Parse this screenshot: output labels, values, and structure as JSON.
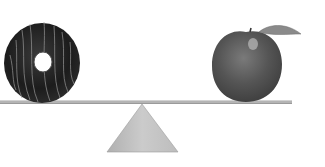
{
  "image": {
    "alt": "A chocolate glazed donut and an apple balanced on a seesaw plank resting on a triangular fulcrum",
    "objects": [
      {
        "name": "donut",
        "side": "left",
        "description": "chocolate-glazed donut with drizzle stripes"
      },
      {
        "name": "apple",
        "side": "right",
        "description": "apple with stem and leaf"
      },
      {
        "name": "plank",
        "description": "flat seesaw board"
      },
      {
        "name": "fulcrum",
        "description": "triangular pivot"
      }
    ],
    "colors": {
      "background": "#ffffff",
      "donut_dark": "#1e1e1e",
      "donut_drizzle": "#9a9a9a",
      "apple_body": "#5a5a5a",
      "apple_highlight": "#a8a8a8",
      "leaf": "#8a8a8a",
      "plank": "#b4b4b4",
      "fulcrum": "#c4c4c4"
    }
  }
}
